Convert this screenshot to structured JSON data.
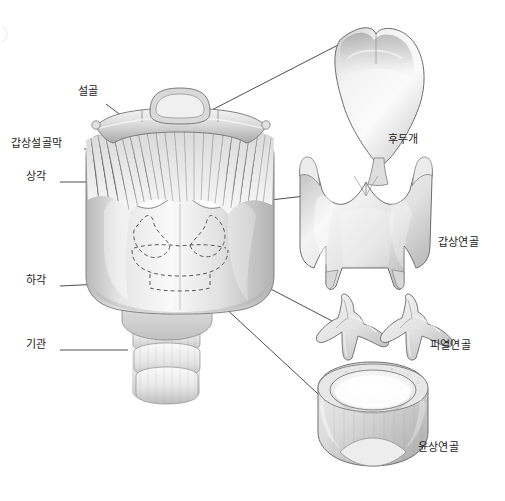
{
  "figure": {
    "width": 505,
    "height": 501,
    "background_color": "#ffffff",
    "ink_color": "#1a1a1a",
    "line_color": "#3a3a3a"
  },
  "labels": {
    "hyoid_bone": {
      "text": "설골",
      "x": 78,
      "y": 92,
      "align": "left",
      "leader": {
        "x1": 106,
        "y1": 104,
        "x2": 143,
        "y2": 132
      }
    },
    "thyrohyoid_membrane": {
      "text": "갑상설골막",
      "x": 11,
      "y": 144,
      "align": "left",
      "leader": {
        "x1": 84,
        "y1": 149,
        "x2": 122,
        "y2": 149
      }
    },
    "superior_horn": {
      "text": "상각",
      "x": 26,
      "y": 177,
      "align": "left",
      "leader": {
        "x1": 60,
        "y1": 182,
        "x2": 104,
        "y2": 182
      }
    },
    "inferior_horn": {
      "text": "하각",
      "x": 26,
      "y": 281,
      "align": "left",
      "leader": {
        "x1": 60,
        "y1": 286,
        "x2": 122,
        "y2": 283
      }
    },
    "trachea": {
      "text": "기관",
      "x": 26,
      "y": 345,
      "align": "left",
      "leader": {
        "x1": 60,
        "y1": 350,
        "x2": 128,
        "y2": 350
      }
    },
    "epiglottis": {
      "text": "후두개",
      "x": 388,
      "y": 140,
      "align": "left",
      "leader": {
        "x1": 204,
        "y1": 114,
        "x2": 340,
        "y2": 44
      }
    },
    "thyroid_cartilage": {
      "text": "갑상연골",
      "x": 438,
      "y": 243,
      "align": "left",
      "leader": {
        "x1": 236,
        "y1": 204,
        "x2": 305,
        "y2": 196
      }
    },
    "arytenoid_cartilage": {
      "text": "피열연골",
      "x": 430,
      "y": 346,
      "align": "left",
      "leader": {
        "x1": 219,
        "y1": 262,
        "x2": 334,
        "y2": 322
      }
    },
    "cricoid_cartilage": {
      "text": "윤상연골",
      "x": 418,
      "y": 448,
      "align": "left",
      "leader": {
        "x1": 208,
        "y1": 292,
        "x2": 330,
        "y2": 405
      }
    }
  },
  "parts": [
    {
      "name": "hyoid-bone",
      "label": "설골"
    },
    {
      "name": "thyrohyoid-membrane",
      "label": "갑상설골막"
    },
    {
      "name": "superior-horn",
      "label": "상각"
    },
    {
      "name": "inferior-horn",
      "label": "하각"
    },
    {
      "name": "trachea",
      "label": "기관"
    },
    {
      "name": "epiglottis",
      "label": "후두개"
    },
    {
      "name": "thyroid-cartilage",
      "label": "갑상연골"
    },
    {
      "name": "arytenoid-cartilage",
      "label": "피열연골"
    },
    {
      "name": "cricoid-cartilage",
      "label": "윤상연골"
    }
  ]
}
